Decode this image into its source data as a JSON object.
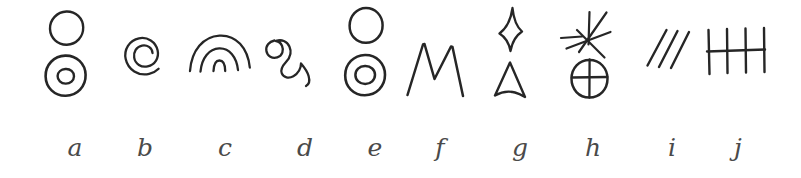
{
  "figure": {
    "background_color": "#ffffff",
    "ink_color": "#262626",
    "label_color": "#4a4a4a",
    "panel_count": 10
  },
  "panels": [
    {
      "label": "a",
      "symbol_name": "circle-above-donut",
      "description": "Open circle above a concentric double circle (donut)",
      "label_left": 55
    },
    {
      "label": "b",
      "symbol_name": "spiral",
      "description": "Single inward coiling spiral resembling an at-sign",
      "label_left": 125
    },
    {
      "label": "c",
      "symbol_name": "nested-arcs",
      "description": "Three nested concentric arcs forming a rainbow",
      "label_left": 205
    },
    {
      "label": "d",
      "symbol_name": "wavy-squiggle",
      "description": "Loose horizontal squiggle with two rounded humps",
      "label_left": 285
    },
    {
      "label": "e",
      "symbol_name": "circle-above-donut",
      "description": "Open circle above a concentric double circle (donut)",
      "label_left": 355
    },
    {
      "label": "f",
      "symbol_name": "m-zigzag",
      "description": "Sharp zigzag shaped like the letter M",
      "label_left": 420
    },
    {
      "label": "g",
      "symbol_name": "diamond-above-triangle",
      "description": "Concave diamond or kite above an open triangle",
      "label_left": 500
    },
    {
      "label": "h",
      "symbol_name": "starburst-above-crossed-circle",
      "description": "Radiating starburst of rays above a circle divided by a cross",
      "label_left": 573
    },
    {
      "label": "i",
      "symbol_name": "three-slashes",
      "description": "Three parallel diagonal strokes",
      "label_left": 652
    },
    {
      "label": "j",
      "symbol_name": "tally-marks",
      "description": "Four vertical strokes crossed by a horizontal bar",
      "label_left": 718
    }
  ]
}
